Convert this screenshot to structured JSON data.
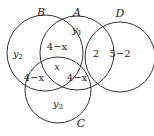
{
  "diagram": {
    "type": "venn",
    "sets": [
      {
        "name": "B",
        "cx": 45,
        "cy": 53,
        "r": 38,
        "label_x": 41,
        "label_y": 16
      },
      {
        "name": "A",
        "cx": 77,
        "cy": 53,
        "r": 37,
        "label_x": 77,
        "label_y": 16
      },
      {
        "name": "D",
        "cx": 120,
        "cy": 57,
        "r": 35,
        "label_x": 120,
        "label_y": 17
      },
      {
        "name": "C",
        "cx": 58,
        "cy": 90,
        "r": 33,
        "label_x": 81,
        "label_y": 127
      }
    ],
    "regions": [
      {
        "id": "A_only",
        "text": "y1",
        "base": "y",
        "sub": "1",
        "x": 77,
        "y": 33
      },
      {
        "id": "B_only",
        "text": "y2",
        "base": "y",
        "sub": "2",
        "x": 18,
        "y": 57
      },
      {
        "id": "C_only",
        "text": "y3",
        "base": "y",
        "sub": "3",
        "x": 58,
        "y": 107
      },
      {
        "id": "A_B",
        "text": "4−x",
        "x": 57,
        "y": 50
      },
      {
        "id": "A_D",
        "text": "2",
        "x": 96,
        "y": 57
      },
      {
        "id": "D_only",
        "text": "5−2",
        "x": 120,
        "y": 57
      },
      {
        "id": "A_B_C",
        "text": "x",
        "x": 57,
        "y": 70
      },
      {
        "id": "B_C",
        "text": "4−x",
        "x": 34,
        "y": 81
      },
      {
        "id": "A_C",
        "text": "4−x",
        "x": 77,
        "y": 81
      }
    ]
  }
}
